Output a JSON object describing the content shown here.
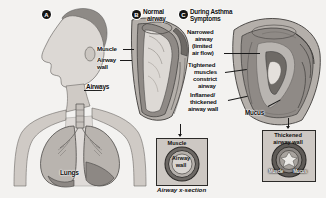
{
  "figure": {
    "caption": "Airway x-section",
    "background_color": "#f3f2f0",
    "ink_color": "#111111"
  },
  "panels": [
    {
      "marker": "A",
      "name": "head-and-lungs-profile"
    },
    {
      "marker": "B",
      "name": "normal-airway"
    },
    {
      "marker": "C",
      "name": "during-asthma-symptoms"
    }
  ],
  "panel_a": {
    "marker": "A",
    "labels": {
      "airways": "Airways",
      "lungs": "Lungs"
    }
  },
  "panel_b": {
    "marker": "B",
    "title_line1": "Normal",
    "title_line2": "airway",
    "labels": {
      "muscle": "Muscle",
      "airway_wall_line1": "Airway",
      "airway_wall_line2": "wall"
    }
  },
  "panel_c": {
    "marker": "C",
    "title_line1": "During Asthma",
    "title_line2": "Symptoms",
    "labels": {
      "narrowed_line1": "Narrowed",
      "narrowed_line2": "airway",
      "narrowed_line3": "(limited",
      "narrowed_line4": "air flow)",
      "tightened_line1": "Tightened",
      "tightened_line2": "muscles",
      "tightened_line3": "constrict",
      "tightened_line4": "airway",
      "inflamed_line1": "Inflamed/",
      "inflamed_line2": "thickened",
      "inflamed_line3": "airway wall",
      "mucus": "Mucus"
    }
  },
  "xsection_normal": {
    "name": "normal-airway-cross-section",
    "outer_label": "Muscle",
    "inner_label_line1": "Airway",
    "inner_label_line2": "wall"
  },
  "xsection_asthma": {
    "name": "asthma-airway-cross-section",
    "title_line1": "Thickened",
    "title_line2": "airway wall",
    "bottom_label_left": "Muscle",
    "bottom_label_right": "Mucus"
  }
}
